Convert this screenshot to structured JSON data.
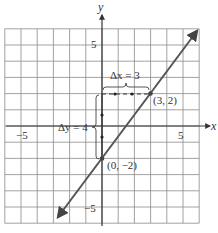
{
  "chart_data": {
    "type": "line",
    "title": "",
    "xlabel": "x",
    "ylabel": "y",
    "xlim": [
      -6,
      6
    ],
    "ylim": [
      -6,
      6
    ],
    "grid": true,
    "x_ticks": [
      {
        "value": -5,
        "label": "−5"
      },
      {
        "value": 5,
        "label": "5"
      }
    ],
    "y_ticks": [
      {
        "value": 5,
        "label": "5"
      },
      {
        "value": -5,
        "label": "−5"
      }
    ],
    "series": [
      {
        "name": "line",
        "equation": "y = (4/3)x - 2",
        "slope": 1.3333,
        "intercept": -2,
        "x": [
          -2.7,
          5.85
        ],
        "y": [
          -5.6,
          5.8
        ],
        "arrows": "both",
        "color": "#555555"
      }
    ],
    "points": [
      {
        "x": 0,
        "y": -2,
        "label": "(0, −2)"
      },
      {
        "x": 3,
        "y": 2,
        "label": "(3, 2)"
      }
    ],
    "annotations": [
      {
        "text": "Δx = 3",
        "type": "horizontal-run",
        "from": [
          0,
          2
        ],
        "to": [
          3,
          2
        ]
      },
      {
        "text": "Δy = 4",
        "type": "vertical-rise",
        "from": [
          0,
          -2
        ],
        "to": [
          0,
          2
        ]
      }
    ]
  },
  "labels": {
    "x_axis": "x",
    "y_axis": "y",
    "tick_x_neg5": "−5",
    "tick_x_5": "5",
    "tick_y_5": "5",
    "tick_y_neg5": "−5",
    "point_a": "(0, −2)",
    "point_b": "(3, 2)",
    "delta_x": "Δx = 3",
    "delta_y": "Δy = 4"
  }
}
